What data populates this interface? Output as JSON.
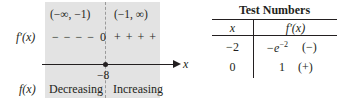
{
  "sign_chart": {
    "intervals": [
      "(−∞, −1)",
      "(−1, ∞)"
    ],
    "derivative_label": "f′(x)",
    "function_label": "f(x)",
    "signs_left": "− − − −",
    "critical_value": "0",
    "signs_right": "+ + + +",
    "axis_label": "x",
    "critical_point_label": "−8",
    "behavior_left": "Decreasing",
    "behavior_right": "Increasing",
    "colors": {
      "panel": "#e3e3e3",
      "ink": "#231f20"
    }
  },
  "test_table": {
    "title": "Test Numbers",
    "headers": [
      "x",
      "f′(x)"
    ],
    "rows": [
      {
        "x": "−2",
        "value": "−e",
        "exp": "−2",
        "sign": "(−)"
      },
      {
        "x": "0",
        "value": "1",
        "exp": "",
        "sign": "(+)"
      }
    ]
  }
}
